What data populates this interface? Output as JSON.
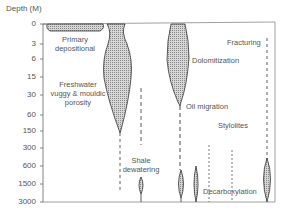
{
  "axis": {
    "title": "Depth (M)",
    "ticks": [
      {
        "label": "0",
        "y": 24
      },
      {
        "label": "3",
        "y": 44
      },
      {
        "label": "6",
        "y": 59
      },
      {
        "label": "15",
        "y": 77
      },
      {
        "label": "30",
        "y": 95
      },
      {
        "label": "60",
        "y": 115
      },
      {
        "label": "150",
        "y": 131
      },
      {
        "label": "300",
        "y": 148
      },
      {
        "label": "600",
        "y": 166
      },
      {
        "label": "1500",
        "y": 184
      },
      {
        "label": "3000",
        "y": 202
      }
    ]
  },
  "processes": {
    "primary": {
      "line1": "Primary",
      "line2": "depositional"
    },
    "freshwater": {
      "line1": "Freshwater",
      "line2": "vuggy & mouldic",
      "line3": "porosity"
    },
    "dolomitization": "Dolomitization",
    "oil_migration": "Oil migration",
    "fracturing": "Fracturing",
    "stylolites": "Stylolites",
    "shale": {
      "line1": "Shale",
      "line2": "dewatering"
    },
    "decarboxylation": "Decarboxylation"
  },
  "colors": {
    "fill": "#bdbdbd",
    "stroke": "#333333",
    "text": "#555555"
  }
}
